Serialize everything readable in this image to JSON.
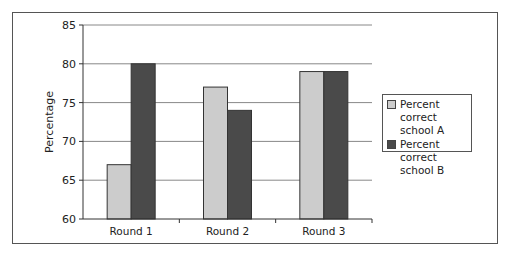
{
  "chart_data": {
    "type": "bar",
    "title": "",
    "xlabel": "",
    "ylabel": "Percentage",
    "ylim": [
      60,
      85
    ],
    "yticks": [
      60,
      65,
      70,
      75,
      80,
      85
    ],
    "grid": true,
    "legend_position": "right",
    "categories": [
      "Round 1",
      "Round 2",
      "Round 3"
    ],
    "series": [
      {
        "name": "Percent correct school A",
        "color": "#cccccc",
        "values": [
          67,
          77,
          79
        ]
      },
      {
        "name": "Percent correct school B",
        "color": "#4a4a4a",
        "values": [
          80,
          74,
          79
        ]
      }
    ]
  },
  "legend": {
    "items": [
      {
        "line1": "Percent correct",
        "line2": "school A",
        "color": "#cccccc"
      },
      {
        "line1": "Percent correct",
        "line2": "school B",
        "color": "#4a4a4a"
      }
    ]
  }
}
